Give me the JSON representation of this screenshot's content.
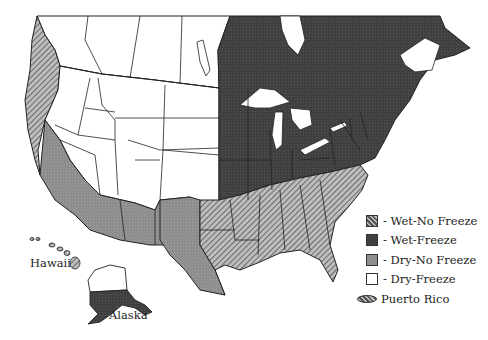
{
  "map": {
    "title": "",
    "colors": {
      "wet_no_freeze": "#9a9a9a",
      "wet_freeze": "#3e3e3e",
      "dry_no_freeze": "#8c8c8c",
      "dry_freeze": "#ffffff",
      "outline": "#222222"
    },
    "legend": {
      "items": [
        {
          "label": "- Wet-No Freeze",
          "pattern": "hatched"
        },
        {
          "label": "- Wet-Freeze",
          "pattern": "dark"
        },
        {
          "label": "- Dry-No Freeze",
          "pattern": "gray"
        },
        {
          "label": "- Dry-Freeze",
          "pattern": "white"
        }
      ]
    },
    "labels": {
      "hawaii": "Hawaii",
      "alaska": "Alaska",
      "puerto_rico": "Puerto Rico"
    },
    "regions": [
      {
        "name": "Pacific Coast",
        "zone": "Wet-No Freeze"
      },
      {
        "name": "West / Mountain / Plains",
        "zone": "Dry-Freeze"
      },
      {
        "name": "Midwest / Northeast / Eastern Canada",
        "zone": "Wet-Freeze"
      },
      {
        "name": "Southeast",
        "zone": "Wet-No Freeze"
      },
      {
        "name": "Southwest / Texas / S. California",
        "zone": "Dry-No Freeze"
      },
      {
        "name": "Hawaii",
        "zone": "Wet-No Freeze"
      },
      {
        "name": "Alaska (north)",
        "zone": "Dry-Freeze"
      },
      {
        "name": "Alaska (south)",
        "zone": "Wet-Freeze"
      },
      {
        "name": "Puerto Rico",
        "zone": "Wet-No Freeze"
      }
    ]
  }
}
